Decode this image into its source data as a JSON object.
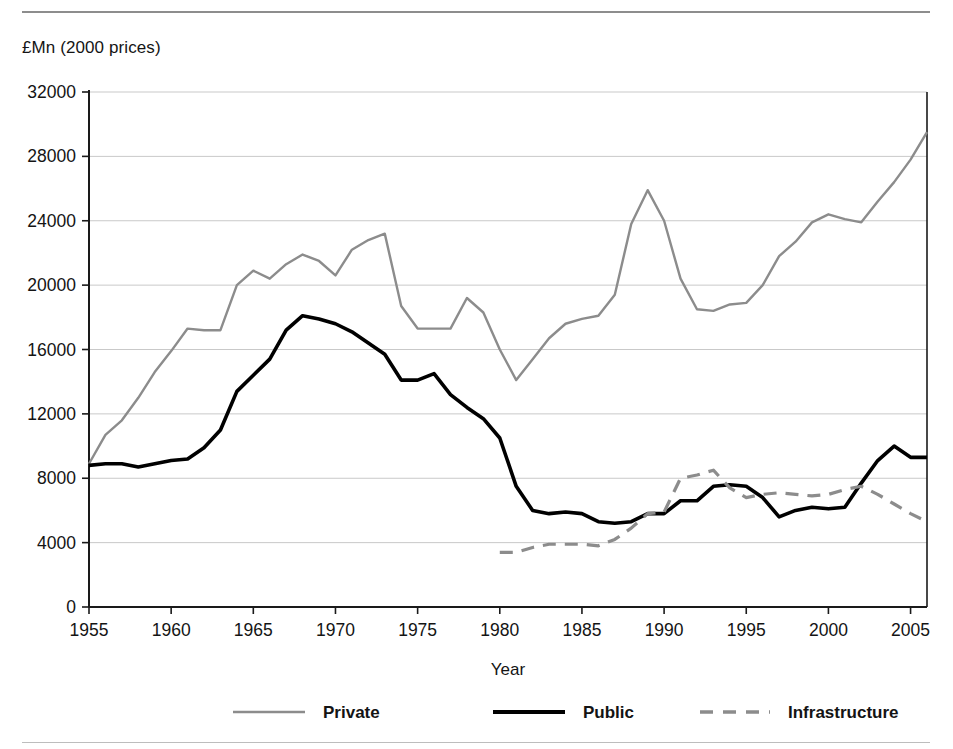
{
  "figure": {
    "y_axis_title": "£Mn (2000 prices)",
    "x_axis_title": "Year"
  },
  "legend": {
    "items": [
      {
        "label": "Private",
        "color": "#8c8c8c",
        "style": "solid"
      },
      {
        "label": "Public",
        "color": "#000000",
        "style": "solid"
      },
      {
        "label": "Infrastructure",
        "color": "#8c8c8c",
        "style": "dashed"
      }
    ]
  },
  "chart_data": {
    "type": "line",
    "title": "",
    "xlabel": "Year",
    "ylabel": "£Mn (2000 prices)",
    "xlim": [
      1955,
      2006
    ],
    "ylim": [
      0,
      32000
    ],
    "grid": true,
    "legend_position": "bottom",
    "ytick_labels": [
      "0",
      "4000",
      "8000",
      "12000",
      "16000",
      "20000",
      "24000",
      "28000",
      "32000"
    ],
    "yticks": [
      0,
      4000,
      8000,
      12000,
      16000,
      20000,
      24000,
      28000,
      32000
    ],
    "xtick_labels": [
      "1955",
      "1960",
      "1965",
      "1970",
      "1975",
      "1980",
      "1985",
      "1990",
      "1995",
      "2000",
      "2005"
    ],
    "xticks": [
      1955,
      1960,
      1965,
      1970,
      1975,
      1980,
      1985,
      1990,
      1995,
      2000,
      2005
    ],
    "x": [
      1955,
      1956,
      1957,
      1958,
      1959,
      1960,
      1961,
      1962,
      1963,
      1964,
      1965,
      1966,
      1967,
      1968,
      1969,
      1970,
      1971,
      1972,
      1973,
      1974,
      1975,
      1976,
      1977,
      1978,
      1979,
      1980,
      1981,
      1982,
      1983,
      1984,
      1985,
      1986,
      1987,
      1988,
      1989,
      1990,
      1991,
      1992,
      1993,
      1994,
      1995,
      1996,
      1997,
      1998,
      1999,
      2000,
      2001,
      2002,
      2003,
      2004,
      2005,
      2006
    ],
    "series": [
      {
        "name": "Private",
        "color": "#8c8c8c",
        "style": "solid",
        "x": [
          1955,
          1956,
          1957,
          1958,
          1959,
          1960,
          1961,
          1962,
          1963,
          1964,
          1965,
          1966,
          1967,
          1968,
          1969,
          1970,
          1971,
          1972,
          1973,
          1974,
          1975,
          1976,
          1977,
          1978,
          1979,
          1980,
          1981,
          1982,
          1983,
          1984,
          1985,
          1986,
          1987,
          1988,
          1989,
          1990,
          1991,
          1992,
          1993,
          1994,
          1995,
          1996,
          1997,
          1998,
          1999,
          2000,
          2001,
          2002,
          2003,
          2004,
          2005,
          2006
        ],
        "values": [
          8900,
          10700,
          11600,
          13000,
          14600,
          15900,
          17300,
          17200,
          17200,
          20000,
          20900,
          20400,
          21300,
          21900,
          21500,
          20600,
          22200,
          22800,
          23200,
          18700,
          17300,
          17300,
          17300,
          19200,
          18300,
          16000,
          14100,
          15400,
          16700,
          17600,
          17900,
          18100,
          19400,
          23800,
          25900,
          24000,
          20400,
          18500,
          18400,
          18800,
          18900,
          20000,
          21800,
          22700,
          23900,
          24400,
          24100,
          23900,
          25200,
          26400,
          27800,
          29500
        ]
      },
      {
        "name": "Public",
        "color": "#000000",
        "style": "solid",
        "x": [
          1955,
          1956,
          1957,
          1958,
          1959,
          1960,
          1961,
          1962,
          1963,
          1964,
          1965,
          1966,
          1967,
          1968,
          1969,
          1970,
          1971,
          1972,
          1973,
          1974,
          1975,
          1976,
          1977,
          1978,
          1979,
          1980,
          1981,
          1982,
          1983,
          1984,
          1985,
          1986,
          1987,
          1988,
          1989,
          1990,
          1991,
          1992,
          1993,
          1994,
          1995,
          1996,
          1997,
          1998,
          1999,
          2000,
          2001,
          2002,
          2003,
          2004,
          2005,
          2006
        ],
        "values": [
          8800,
          8900,
          8900,
          8700,
          8900,
          9100,
          9200,
          9900,
          11000,
          13400,
          14400,
          15400,
          17200,
          18100,
          17900,
          17600,
          17100,
          16400,
          15700,
          14100,
          14100,
          14500,
          13200,
          12400,
          11700,
          10500,
          7500,
          6000,
          5800,
          5900,
          5800,
          5300,
          5200,
          5300,
          5800,
          5800,
          6600,
          6600,
          7500,
          7600,
          7500,
          6800,
          5600,
          6000,
          6200,
          6100,
          6200,
          7700,
          9100,
          10000,
          9300,
          9300
        ]
      },
      {
        "name": "Infrastructure",
        "color": "#8c8c8c",
        "style": "dashed",
        "x": [
          1980,
          1981,
          1982,
          1983,
          1984,
          1985,
          1986,
          1987,
          1988,
          1989,
          1990,
          1991,
          1992,
          1993,
          1994,
          1995,
          1996,
          1997,
          1998,
          1999,
          2000,
          2001,
          2002,
          2003,
          2004,
          2005,
          2006
        ],
        "values": [
          3400,
          3400,
          3700,
          3900,
          3900,
          3900,
          3800,
          4200,
          4900,
          5800,
          5900,
          8000,
          8200,
          8500,
          7400,
          6800,
          7000,
          7100,
          7000,
          6900,
          7000,
          7300,
          7500,
          7000,
          6400,
          5800,
          5300
        ]
      }
    ]
  }
}
